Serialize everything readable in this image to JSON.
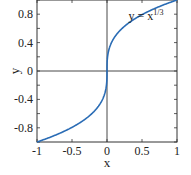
{
  "chart_data": {
    "type": "line",
    "title": "",
    "xlabel": "x",
    "ylabel": "y",
    "xlim": [
      -1,
      1
    ],
    "ylim": [
      -1,
      1
    ],
    "grid": false,
    "x_ticks": [
      -1,
      -0.5,
      0,
      0.5,
      1
    ],
    "x_tick_labels": [
      "-1",
      "-0.5",
      "0",
      "0.5",
      "1"
    ],
    "y_ticks": [
      -0.8,
      -0.4,
      0,
      0.4,
      0.8
    ],
    "y_tick_labels": [
      "-0.8",
      "-0.4",
      "0",
      "0.4",
      "0.8"
    ],
    "zero_lines": true,
    "series": [
      {
        "name": "y = x^(1/3)",
        "color": "#2a6cb5",
        "function": "cube_root",
        "x": [
          -1,
          -0.8,
          -0.6,
          -0.4,
          -0.2,
          -0.1,
          -0.05,
          -0.01,
          0,
          0.01,
          0.05,
          0.1,
          0.2,
          0.4,
          0.6,
          0.8,
          1
        ],
        "y": [
          -1,
          -0.928,
          -0.843,
          -0.737,
          -0.585,
          -0.464,
          -0.368,
          -0.215,
          0,
          0.215,
          0.368,
          0.464,
          0.585,
          0.737,
          0.843,
          0.928,
          1
        ]
      }
    ],
    "annotations": [
      {
        "text_base": "y = x",
        "text_sup": "1/3",
        "x": 0.35,
        "y": 0.78
      }
    ]
  }
}
